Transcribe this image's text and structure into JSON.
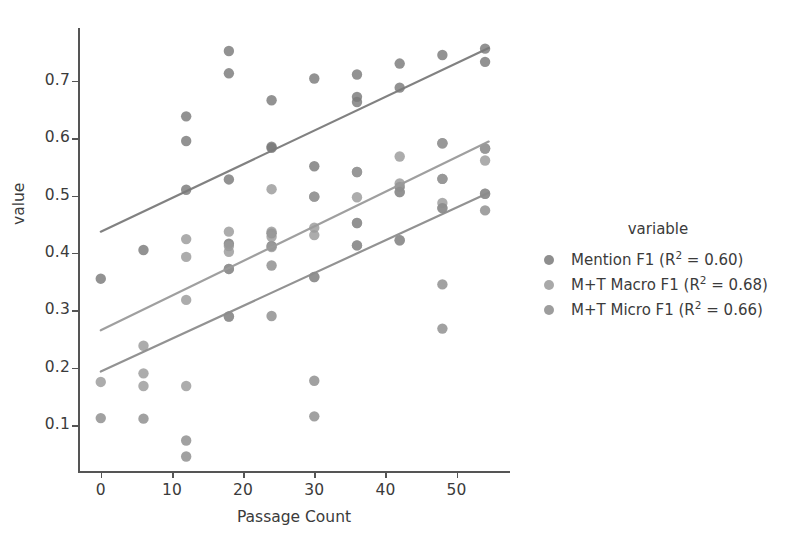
{
  "chart_data": {
    "type": "scatter",
    "title": "",
    "xlabel": "Passage Count",
    "ylabel": "value",
    "xlim": [
      -3.2,
      57.5
    ],
    "ylim": [
      0.018,
      0.792
    ],
    "xticks": [
      0,
      10,
      20,
      30,
      40,
      50
    ],
    "yticks": [
      0.1,
      0.2,
      0.3,
      0.4,
      0.5,
      0.6,
      0.7
    ],
    "ytick_labels": [
      "0.1",
      "0.2",
      "0.3",
      "0.4",
      "0.5",
      "0.6",
      "0.7"
    ],
    "xtick_labels": [
      "0",
      "10",
      "20",
      "30",
      "40",
      "50"
    ],
    "grid": false,
    "legend_position": "right",
    "legend_title": "variable",
    "series": [
      {
        "name": "Mention F1 (R² = 0.60)",
        "label_text": "Mention F1 (R",
        "label_sup": "2",
        "label_tail": " = 0.60)",
        "color": "#7a7a7a",
        "points": [
          [
            0,
            0.355
          ],
          [
            6,
            0.405
          ],
          [
            12,
            0.638
          ],
          [
            12,
            0.595
          ],
          [
            12,
            0.51
          ],
          [
            18,
            0.752
          ],
          [
            18,
            0.713
          ],
          [
            18,
            0.528
          ],
          [
            18,
            0.416
          ],
          [
            24,
            0.666
          ],
          [
            24,
            0.585
          ],
          [
            24,
            0.583
          ],
          [
            24,
            0.434
          ],
          [
            24,
            0.412
          ],
          [
            30,
            0.704
          ],
          [
            30,
            0.551
          ],
          [
            30,
            0.498
          ],
          [
            36,
            0.711
          ],
          [
            36,
            0.672
          ],
          [
            36,
            0.663
          ],
          [
            36,
            0.541
          ],
          [
            42,
            0.73
          ],
          [
            42,
            0.688
          ],
          [
            42,
            0.515
          ],
          [
            48,
            0.745
          ],
          [
            48,
            0.591
          ],
          [
            48,
            0.529
          ],
          [
            54,
            0.756
          ],
          [
            54,
            0.733
          ],
          [
            54,
            0.582
          ]
        ],
        "fit": {
          "x0": 0,
          "y0": 0.437,
          "x1": 54.5,
          "y1": 0.757
        }
      },
      {
        "name": "M+T Macro F1 (R² = 0.68)",
        "label_text": "M+T Macro F1 (R",
        "label_sup": "2",
        "label_tail": " = 0.68)",
        "color": "#9a9a9a",
        "points": [
          [
            0,
            0.175
          ],
          [
            6,
            0.238
          ],
          [
            6,
            0.19
          ],
          [
            6,
            0.168
          ],
          [
            12,
            0.424
          ],
          [
            12,
            0.393
          ],
          [
            12,
            0.318
          ],
          [
            12,
            0.168
          ],
          [
            18,
            0.437
          ],
          [
            18,
            0.412
          ],
          [
            18,
            0.402
          ],
          [
            18,
            0.372
          ],
          [
            18,
            0.289
          ],
          [
            24,
            0.511
          ],
          [
            24,
            0.437
          ],
          [
            24,
            0.428
          ],
          [
            24,
            0.41
          ],
          [
            30,
            0.498
          ],
          [
            30,
            0.444
          ],
          [
            30,
            0.431
          ],
          [
            30,
            0.358
          ],
          [
            36,
            0.541
          ],
          [
            36,
            0.497
          ],
          [
            36,
            0.452
          ],
          [
            36,
            0.413
          ],
          [
            42,
            0.568
          ],
          [
            42,
            0.521
          ],
          [
            42,
            0.506
          ],
          [
            42,
            0.422
          ],
          [
            48,
            0.591
          ],
          [
            48,
            0.529
          ],
          [
            48,
            0.487
          ],
          [
            48,
            0.478
          ],
          [
            54,
            0.582
          ],
          [
            54,
            0.561
          ],
          [
            54,
            0.503
          ]
        ],
        "fit": {
          "x0": 0,
          "y0": 0.265,
          "x1": 54.5,
          "y1": 0.594
        }
      },
      {
        "name": "M+T Micro F1 (R² = 0.66)",
        "label_text": "M+T Micro F1 (R",
        "label_sup": "2",
        "label_tail": " = 0.66)",
        "color": "#8c8c8c",
        "points": [
          [
            0,
            0.112
          ],
          [
            6,
            0.111
          ],
          [
            12,
            0.073
          ],
          [
            12,
            0.045
          ],
          [
            18,
            0.372
          ],
          [
            18,
            0.289
          ],
          [
            24,
            0.378
          ],
          [
            24,
            0.29
          ],
          [
            30,
            0.358
          ],
          [
            30,
            0.177
          ],
          [
            30,
            0.115
          ],
          [
            36,
            0.413
          ],
          [
            36,
            0.452
          ],
          [
            42,
            0.422
          ],
          [
            42,
            0.506
          ],
          [
            48,
            0.478
          ],
          [
            48,
            0.345
          ],
          [
            48,
            0.268
          ],
          [
            54,
            0.503
          ],
          [
            54,
            0.474
          ]
        ],
        "fit": {
          "x0": 0,
          "y0": 0.193,
          "x1": 54.5,
          "y1": 0.505
        }
      }
    ]
  },
  "legend": {
    "title": "variable"
  },
  "axes": {
    "xlabel": "Passage Count",
    "ylabel": "value"
  }
}
